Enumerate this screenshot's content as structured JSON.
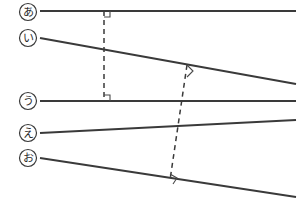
{
  "figure": {
    "background_color": "#ffffff",
    "line_color": "#3a3a3a",
    "width": 307,
    "height": 213,
    "labels": [
      {
        "id": "a",
        "text": "あ",
        "cx": 28,
        "cy": 12
      },
      {
        "id": "i",
        "text": "い",
        "cx": 28,
        "cy": 38
      },
      {
        "id": "u",
        "text": "う",
        "cx": 28,
        "cy": 101
      },
      {
        "id": "e",
        "text": "え",
        "cx": 28,
        "cy": 133
      },
      {
        "id": "o",
        "text": "お",
        "cx": 28,
        "cy": 158
      }
    ],
    "solid_lines": [
      {
        "id": "line-a",
        "label": "あ",
        "x1": 40,
        "y1": 11,
        "x2": 296,
        "y2": 11
      },
      {
        "id": "line-i",
        "label": "い",
        "x1": 40,
        "y1": 38,
        "x2": 296,
        "y2": 84
      },
      {
        "id": "line-u",
        "label": "う",
        "x1": 40,
        "y1": 101,
        "x2": 296,
        "y2": 101
      },
      {
        "id": "line-e",
        "label": "え",
        "x1": 40,
        "y1": 133,
        "x2": 296,
        "y2": 120
      },
      {
        "id": "line-o",
        "label": "お",
        "x1": 40,
        "y1": 158,
        "x2": 296,
        "y2": 197
      }
    ],
    "dashed_lines": [
      {
        "id": "perpendicular-1",
        "x1": 104,
        "y1": 11,
        "x2": 104,
        "y2": 101
      },
      {
        "id": "perpendicular-2",
        "x1": 187,
        "y1": 65,
        "x2": 170,
        "y2": 180
      }
    ],
    "right_angle_marks": [
      {
        "id": "angle-at-a",
        "points": "104,17 110,17 110,11"
      },
      {
        "id": "angle-at-u",
        "points": "104,95 110,95 110,101"
      },
      {
        "id": "angle-at-i",
        "points": "187,65 193,71 187,77"
      },
      {
        "id": "angle-at-o",
        "points": "170,174 177,178 173,184"
      }
    ]
  }
}
